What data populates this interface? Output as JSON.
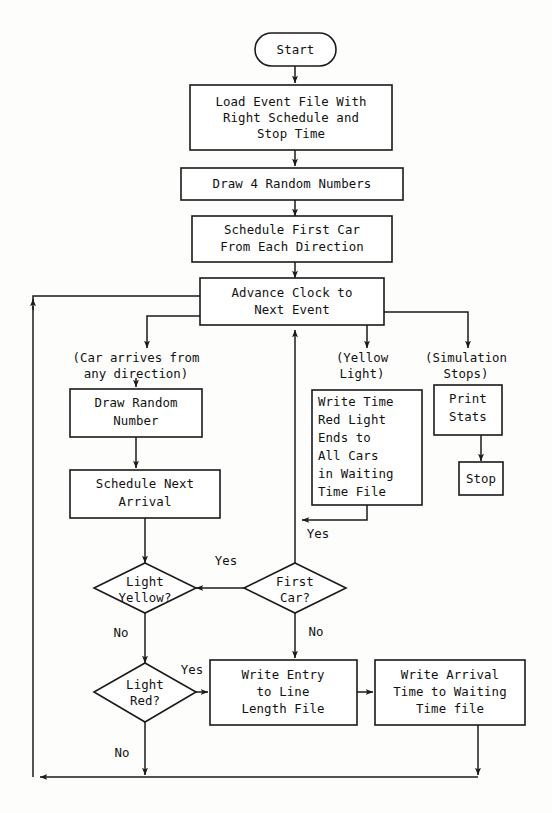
{
  "diagram": {
    "type": "flowchart",
    "canvas": {
      "width": 552,
      "height": 813
    },
    "stroke_color": "#1a1a1a",
    "fill_color": "#ffffff",
    "background_color": "#fdfdfc"
  },
  "nodes": {
    "start": {
      "label": "Start",
      "shape": "terminator"
    },
    "load_event_file": {
      "shape": "process",
      "lines": [
        "Load Event File With",
        "Right Schedule and",
        "Stop Time"
      ]
    },
    "draw_four_random": {
      "shape": "process",
      "lines": [
        "Draw 4 Random Numbers"
      ]
    },
    "schedule_first_car": {
      "shape": "process",
      "lines": [
        "Schedule First Car",
        "From Each Direction"
      ]
    },
    "advance_clock": {
      "shape": "process",
      "lines": [
        "Advance Clock to",
        "Next Event"
      ]
    },
    "draw_random_number": {
      "shape": "process",
      "lines": [
        "Draw Random",
        "Number"
      ]
    },
    "schedule_next_arrival": {
      "shape": "process",
      "lines": [
        "Schedule Next",
        "Arrival"
      ]
    },
    "write_time_red_light": {
      "shape": "process",
      "lines": [
        "Write Time",
        "Red Light",
        "Ends to",
        "All Cars",
        "in Waiting",
        "Time File"
      ]
    },
    "print_stats": {
      "shape": "process",
      "lines": [
        "Print",
        "Stats"
      ]
    },
    "stop": {
      "shape": "process",
      "lines": [
        "Stop"
      ]
    },
    "light_yellow": {
      "shape": "decision",
      "lines": [
        "Light",
        "Yellow?"
      ]
    },
    "first_car": {
      "shape": "decision",
      "lines": [
        "First",
        "Car?"
      ]
    },
    "light_red": {
      "shape": "decision",
      "lines": [
        "Light",
        "Red?"
      ]
    },
    "write_entry_line_length": {
      "shape": "process",
      "lines": [
        "Write Entry",
        "to Line",
        "Length File"
      ]
    },
    "write_arrival_waiting": {
      "shape": "process",
      "lines": [
        "Write Arrival",
        "Time to Waiting",
        "Time file"
      ]
    }
  },
  "branch_notes": {
    "car_arrives": [
      "(Car arrives from",
      "any direction)"
    ],
    "yellow_light": [
      "(Yellow",
      "Light)"
    ],
    "simulation_stops": [
      "(Simulation",
      "Stops)"
    ]
  },
  "edge_labels": {
    "write_time_to_clock_yes": "Yes",
    "first_car_yes": "Yes",
    "first_car_no": "No",
    "light_yellow_no": "No",
    "light_red_yes": "Yes",
    "light_red_no": "No"
  }
}
